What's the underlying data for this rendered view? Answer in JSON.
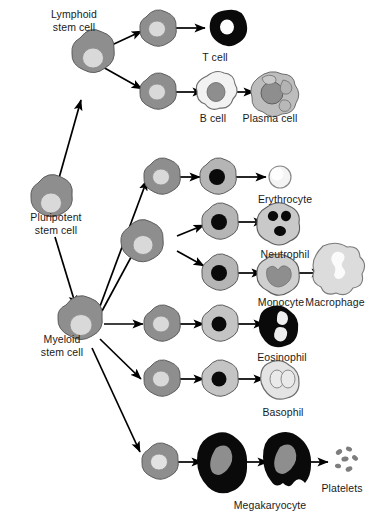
{
  "diagram": {
    "background": "#ffffff",
    "colors": {
      "cytoplasm_gray": "#8e8e8e",
      "nucleus_light": "#d8d8d8",
      "nucleus_mid": "#9a9a9a",
      "black": "#000000",
      "pale": "#e8e8e8",
      "outline": "#5a5a5a",
      "arrow": "#000000",
      "text": "#1a1a1a"
    },
    "labels": {
      "lymphoid_stem_cell": "Lymphoid\nstem cell",
      "pluripotent_stem_cell": "Pluripotent\nstem cell",
      "myeloid_stem_cell": "Myeloid\nstem cell",
      "t_cell": "T cell",
      "b_cell": "B cell",
      "plasma_cell": "Plasma cell",
      "erythrocyte": "Erythrocyte",
      "neutrophil": "Neutrophil",
      "monocyte": "Monocyte",
      "macrophage": "Macrophage",
      "eosinophil": "Eosinophil",
      "basophil": "Basophil",
      "megakaryocyte": "Megakaryocyte",
      "platelets": "Platelets"
    },
    "label_positions": {
      "lymphoid_stem_cell": {
        "x": 24,
        "y": 8,
        "w": 100
      },
      "pluripotent_stem_cell": {
        "x": 6,
        "y": 211,
        "w": 100
      },
      "myeloid_stem_cell": {
        "x": 16,
        "y": 333,
        "w": 92
      },
      "t_cell": {
        "x": 180,
        "y": 51,
        "w": 70
      },
      "b_cell": {
        "x": 178,
        "y": 112,
        "w": 70
      },
      "plasma_cell": {
        "x": 227,
        "y": 112,
        "w": 86
      },
      "erythrocyte": {
        "x": 239,
        "y": 193,
        "w": 92
      },
      "neutrophil": {
        "x": 242,
        "y": 248,
        "w": 86
      },
      "monocyte": {
        "x": 240,
        "y": 296,
        "w": 82
      },
      "macrophage": {
        "x": 297,
        "y": 296,
        "w": 76
      },
      "eosinophil": {
        "x": 239,
        "y": 351,
        "w": 86
      },
      "basophil": {
        "x": 244,
        "y": 406,
        "w": 78
      },
      "megakaryocyte": {
        "x": 215,
        "y": 499,
        "w": 110
      },
      "platelets": {
        "x": 311,
        "y": 482,
        "w": 62
      }
    },
    "lineages": [
      {
        "name": "lymphoid",
        "stem_cell": "Lymphoid stem cell",
        "branches": [
          {
            "progenitor": "lymphoid progenitor",
            "mature": "T cell"
          },
          {
            "progenitor": "lymphoid progenitor",
            "mature": "B cell",
            "terminal": "Plasma cell"
          }
        ]
      },
      {
        "name": "myeloid",
        "stem_cell": "Myeloid stem cell",
        "branches": [
          {
            "progenitor": "erythroid progenitor",
            "intermediate": "erythroblast",
            "mature": "Erythrocyte"
          },
          {
            "progenitor": "granulocyte-monocyte progenitor",
            "intermediate": "myeloblast",
            "mature": "Neutrophil"
          },
          {
            "progenitor": "granulocyte-monocyte progenitor",
            "intermediate": "monoblast",
            "mature": "Monocyte",
            "terminal": "Macrophage"
          },
          {
            "progenitor": "eosinophil progenitor",
            "intermediate": "eosinophil myelocyte",
            "mature": "Eosinophil"
          },
          {
            "progenitor": "basophil progenitor",
            "intermediate": "basophil myelocyte",
            "mature": "Basophil"
          },
          {
            "progenitor": "megakaryocyte progenitor",
            "intermediate": "megakaryoblast",
            "mature": "Megakaryocyte",
            "terminal": "Platelets"
          }
        ]
      }
    ],
    "cell_count": 24,
    "arrow_count": 21
  }
}
